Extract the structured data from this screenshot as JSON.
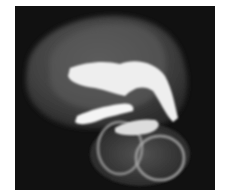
{
  "image": {
    "description": "Grayscale volume rendering of translucent anatomical structure on black background",
    "colors": {
      "background": "#ffffff",
      "frame": "#111111",
      "outer_shell": "#4a4a4a",
      "inner_shell": "#5e5e5e",
      "bright_structure": "#f2f2f2"
    }
  }
}
